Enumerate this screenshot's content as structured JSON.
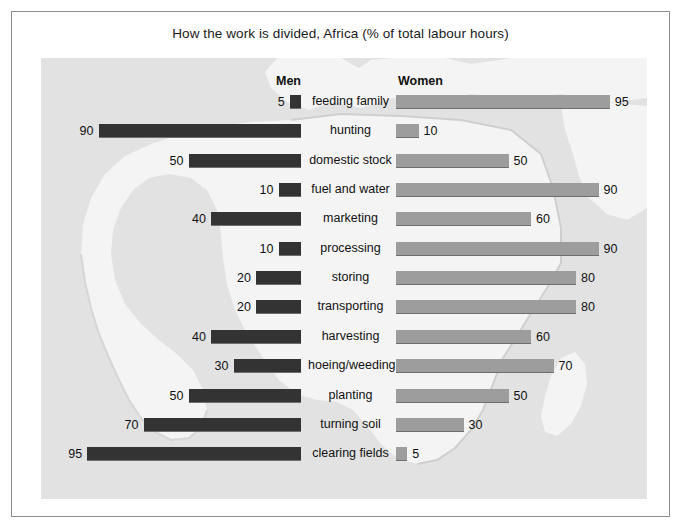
{
  "figure": {
    "title": "How the work is divided, Africa (% of total labour hours)",
    "left_header": "Men",
    "right_header": "Women"
  },
  "colors": {
    "men_bar": "#333333",
    "women_bar": "#9d9d9d",
    "map_sea": "#e2e2e2",
    "map_land": "#f4f4f4",
    "frame": "#8d8d8d",
    "text": "#111111"
  },
  "chart_data": {
    "type": "bar",
    "title": "How the work is divided, Africa (% of total labour hours)",
    "subtitle": "",
    "xlabel": "",
    "ylabel": "",
    "orientation": "horizontal",
    "style": "diverging bidirectional (butterfly / tornado) bar chart",
    "xlim": [
      0,
      100
    ],
    "grid": false,
    "legend_position": "column headers above bars",
    "categories": [
      "feeding family",
      "hunting",
      "domestic stock",
      "fuel and water",
      "marketing",
      "processing",
      "storing",
      "transporting",
      "harvesting",
      "hoeing/weeding",
      "planting",
      "turning soil",
      "clearing fields"
    ],
    "series": [
      {
        "name": "Men",
        "side": "left",
        "color": "#333333",
        "values": [
          5,
          90,
          50,
          10,
          40,
          10,
          20,
          20,
          40,
          30,
          50,
          70,
          95
        ]
      },
      {
        "name": "Women",
        "side": "right",
        "color": "#9d9d9d",
        "values": [
          95,
          10,
          50,
          90,
          60,
          90,
          80,
          80,
          60,
          70,
          50,
          30,
          5
        ]
      }
    ],
    "rows": [
      {
        "category": "feeding family",
        "men": 5,
        "women": 95
      },
      {
        "category": "hunting",
        "men": 90,
        "women": 10
      },
      {
        "category": "domestic stock",
        "men": 50,
        "women": 50
      },
      {
        "category": "fuel and water",
        "men": 10,
        "women": 90
      },
      {
        "category": "marketing",
        "men": 40,
        "women": 60
      },
      {
        "category": "processing",
        "men": 10,
        "women": 90
      },
      {
        "category": "storing",
        "men": 20,
        "women": 80
      },
      {
        "category": "transporting",
        "men": 20,
        "women": 80
      },
      {
        "category": "harvesting",
        "men": 40,
        "women": 60
      },
      {
        "category": "hoeing/weeding",
        "men": 30,
        "women": 70
      },
      {
        "category": "planting",
        "men": 50,
        "women": 50
      },
      {
        "category": "turning soil",
        "men": 70,
        "women": 30
      },
      {
        "category": "clearing fields",
        "men": 95,
        "women": 5
      }
    ],
    "annotations": [
      "Each row's Men value and Women value sum to 100."
    ],
    "background_image": "stylised outline map of Africa"
  }
}
